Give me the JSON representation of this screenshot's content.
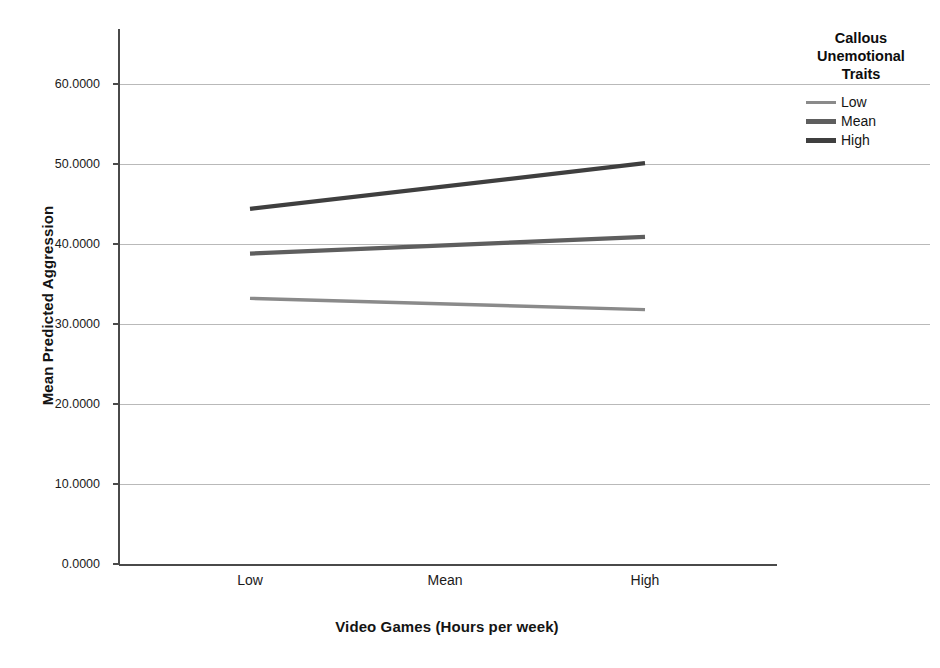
{
  "chart_data": {
    "type": "line",
    "title": "",
    "xlabel": "Video Games (Hours per week)",
    "ylabel": "Mean Predicted Aggression",
    "categories": [
      "Low",
      "Mean",
      "High"
    ],
    "x_tick_labels": [
      "Low",
      "Mean",
      "High"
    ],
    "y_tick_labels": [
      "0.0000",
      "10.0000",
      "20.0000",
      "30.0000",
      "40.0000",
      "50.0000",
      "60.0000"
    ],
    "y_tick_values": [
      0,
      10,
      20,
      30,
      40,
      50,
      60
    ],
    "ylim": [
      0,
      66
    ],
    "grid": "horizontal",
    "legend_position": "right",
    "legend_title": "Callous Unemotional Traits",
    "series": [
      {
        "name": "Low",
        "color": "#8a8a8a",
        "x": [
          "Low",
          "High"
        ],
        "values": [
          33.2,
          31.8
        ]
      },
      {
        "name": "Mean",
        "color": "#5e5e5e",
        "x": [
          "Low",
          "High"
        ],
        "values": [
          38.8,
          40.9
        ]
      },
      {
        "name": "High",
        "color": "#3f3f3f",
        "x": [
          "Low",
          "High"
        ],
        "values": [
          44.4,
          50.1
        ]
      }
    ]
  },
  "axes": {
    "y_title": "Mean Predicted Aggression",
    "x_title": "Video Games (Hours per week)",
    "y_ticks": [
      {
        "label": "60.0000",
        "value": 60
      },
      {
        "label": "50.0000",
        "value": 50
      },
      {
        "label": "40.0000",
        "value": 40
      },
      {
        "label": "30.0000",
        "value": 30
      },
      {
        "label": "20.0000",
        "value": 20
      },
      {
        "label": "10.0000",
        "value": 10
      },
      {
        "label": "0.0000",
        "value": 0
      }
    ],
    "x_ticks": [
      {
        "label": "Low"
      },
      {
        "label": "Mean"
      },
      {
        "label": "High"
      }
    ]
  },
  "legend": {
    "title_line1": "Callous",
    "title_line2": "Unemotional",
    "title_line3": "Traits",
    "items": [
      {
        "label": "Low",
        "color": "#8a8a8a"
      },
      {
        "label": "Mean",
        "color": "#5e5e5e"
      },
      {
        "label": "High",
        "color": "#3f3f3f"
      }
    ]
  },
  "colors": {
    "axis": "#555555",
    "grid": "#b9b9b9",
    "text": "#141414",
    "background": "#ffffff"
  }
}
